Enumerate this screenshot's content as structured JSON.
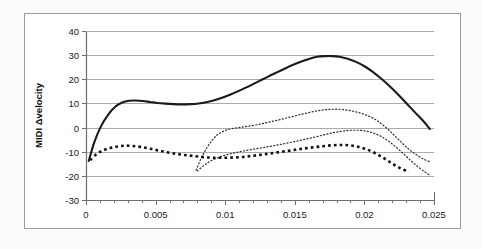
{
  "chart_data": {
    "type": "line",
    "title": "",
    "subtitle": "",
    "xlabel": "",
    "ylabel": "MIDI Δvelocity",
    "xlim": [
      0,
      0.025
    ],
    "ylim": [
      -30,
      40
    ],
    "x_ticks": [
      0,
      0.005,
      0.01,
      0.015,
      0.02,
      0.025
    ],
    "x_tick_labels": [
      "0",
      "0.005",
      "0.01",
      "0.015",
      "0.02",
      "0.025"
    ],
    "x_minor_tick_count": 25,
    "y_ticks": [
      -30,
      -20,
      -10,
      0,
      10,
      20,
      30,
      40
    ],
    "y_tick_labels": [
      "-30",
      "-20",
      "-10",
      "0",
      "10",
      "20",
      "30",
      "40"
    ],
    "grid": {
      "horizontal": true,
      "vertical": false,
      "color": "#aaaaaa"
    },
    "legend": {
      "visible": false,
      "position": "none"
    },
    "plot_border_color": "#808080",
    "outer_border_color": "#9a9a9a",
    "series": [
      {
        "name": "solid-curve",
        "style": "solid",
        "color": "#1a1a1a",
        "width": 2.1,
        "x": [
          0.0002,
          0.0006,
          0.0011,
          0.0016,
          0.0021,
          0.0026,
          0.0031,
          0.0036,
          0.0041,
          0.0046,
          0.0051,
          0.0057,
          0.0063,
          0.0069,
          0.0075,
          0.0081,
          0.0088,
          0.0095,
          0.0103,
          0.0111,
          0.0119,
          0.0127,
          0.0135,
          0.0143,
          0.0151,
          0.0159,
          0.0166,
          0.0172,
          0.0177,
          0.0182,
          0.0188,
          0.0194,
          0.02,
          0.0206,
          0.0212,
          0.0218,
          0.0224,
          0.023,
          0.0236,
          0.0242,
          0.0247
        ],
        "y": [
          -13.8,
          -6.0,
          0.8,
          5.4,
          8.6,
          10.4,
          11.1,
          11.2,
          11.0,
          10.6,
          10.2,
          9.9,
          9.7,
          9.6,
          9.7,
          10.0,
          10.7,
          11.8,
          13.5,
          15.5,
          17.7,
          20.0,
          22.3,
          24.5,
          26.5,
          28.2,
          29.3,
          29.6,
          29.6,
          29.3,
          28.5,
          27.2,
          25.4,
          23.1,
          20.3,
          17.2,
          13.8,
          10.2,
          6.5,
          2.9,
          -0.6
        ]
      },
      {
        "name": "upper-fine-dotted-curve",
        "style": "fine-dotted",
        "color": "#2b2b2b",
        "width": 1.2,
        "x": [
          0.0079,
          0.0083,
          0.0087,
          0.0091,
          0.0095,
          0.01,
          0.0105,
          0.0111,
          0.0117,
          0.0124,
          0.0131,
          0.0138,
          0.0145,
          0.0152,
          0.0159,
          0.0166,
          0.0172,
          0.0178,
          0.0184,
          0.019,
          0.0196,
          0.0202,
          0.0208,
          0.0213,
          0.0218,
          0.0223,
          0.0228,
          0.0233,
          0.0238,
          0.0243,
          0.0247
        ],
        "y": [
          -17.6,
          -12.4,
          -8.2,
          -5.0,
          -2.7,
          -1.2,
          -0.4,
          0.1,
          0.6,
          1.3,
          2.2,
          3.1,
          4.1,
          5.1,
          6.1,
          6.9,
          7.4,
          7.6,
          7.5,
          7.0,
          6.2,
          5.0,
          3.3,
          1.2,
          -1.3,
          -4.1,
          -6.9,
          -9.5,
          -11.5,
          -13.2,
          -14.2
        ]
      },
      {
        "name": "lower-fine-dotted-curve",
        "style": "fine-dotted",
        "color": "#2b2b2b",
        "width": 1.2,
        "x": [
          0.008,
          0.0085,
          0.009,
          0.0096,
          0.0102,
          0.0108,
          0.0115,
          0.0122,
          0.0129,
          0.0136,
          0.0143,
          0.015,
          0.0157,
          0.0164,
          0.0171,
          0.0177,
          0.0183,
          0.0188,
          0.0193,
          0.0198,
          0.0203,
          0.0208,
          0.0213,
          0.0218,
          0.0223,
          0.0228,
          0.0233,
          0.0238,
          0.0243,
          0.0247
        ],
        "y": [
          -17.9,
          -15.6,
          -13.7,
          -12.2,
          -11.1,
          -10.3,
          -9.5,
          -8.8,
          -8.1,
          -7.4,
          -6.6,
          -5.8,
          -4.9,
          -4.0,
          -3.0,
          -2.2,
          -1.6,
          -1.2,
          -1.1,
          -1.2,
          -1.7,
          -2.6,
          -4.0,
          -5.9,
          -8.2,
          -10.8,
          -13.5,
          -16.0,
          -18.2,
          -19.7
        ]
      },
      {
        "name": "square-dotted-curve",
        "style": "square-dotted",
        "color": "#111111",
        "width": 2.6,
        "x": [
          0.0003,
          0.0008,
          0.0013,
          0.0018,
          0.0023,
          0.0028,
          0.0033,
          0.0038,
          0.0043,
          0.0048,
          0.0053,
          0.0058,
          0.0064,
          0.007,
          0.0076,
          0.0082,
          0.0088,
          0.0094,
          0.01,
          0.0106,
          0.0112,
          0.0118,
          0.0124,
          0.013,
          0.0136,
          0.0142,
          0.0148,
          0.0154,
          0.016,
          0.0166,
          0.0172,
          0.0178,
          0.0184,
          0.019,
          0.0196,
          0.0202,
          0.0208,
          0.0214,
          0.022,
          0.0226,
          0.0232
        ],
        "y": [
          -13.5,
          -10.8,
          -9.3,
          -8.4,
          -7.8,
          -7.5,
          -7.6,
          -7.9,
          -8.4,
          -9.0,
          -9.6,
          -10.2,
          -10.8,
          -11.3,
          -11.7,
          -12.1,
          -12.4,
          -12.5,
          -12.5,
          -12.4,
          -12.2,
          -11.8,
          -11.4,
          -10.9,
          -10.4,
          -9.9,
          -9.4,
          -8.9,
          -8.4,
          -8.0,
          -7.6,
          -7.3,
          -7.2,
          -7.4,
          -8.0,
          -9.1,
          -10.7,
          -12.7,
          -14.9,
          -16.9,
          -18.4
        ]
      }
    ]
  },
  "axis": {
    "y_title": "MIDI Δvelocity"
  }
}
